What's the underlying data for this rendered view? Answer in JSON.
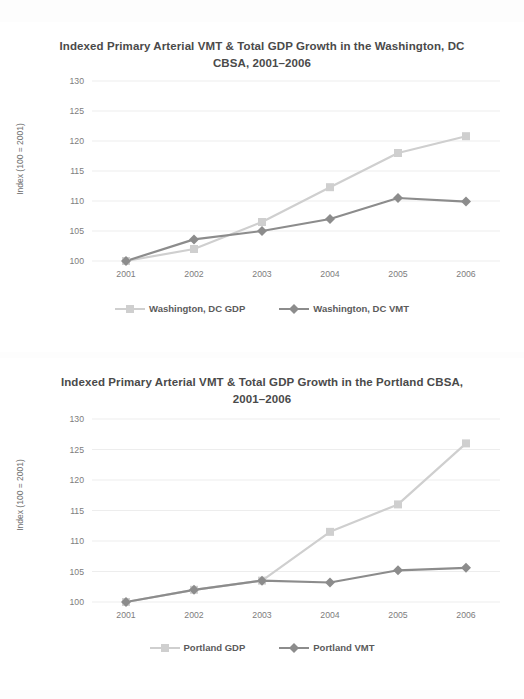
{
  "figures": [
    {
      "id": "washington",
      "title": "Indexed Primary Arterial VMT & Total GDP Growth in the Washington, DC CBSA, 2001–2006",
      "legend": [
        {
          "label": "Washington, DC GDP",
          "marker": "square",
          "color": "#cfcfcf"
        },
        {
          "label": "Washington, DC VMT",
          "marker": "diamond",
          "color": "#8c8c8c"
        }
      ]
    },
    {
      "id": "portland",
      "title": "Indexed Primary Arterial VMT & Total GDP Growth in the Portland CBSA, 2001–2006",
      "legend": [
        {
          "label": "Portland GDP",
          "marker": "square",
          "color": "#cfcfcf"
        },
        {
          "label": "Portland VMT",
          "marker": "diamond",
          "color": "#8c8c8c"
        }
      ]
    }
  ],
  "chart_data": [
    {
      "type": "line",
      "title": "Indexed Primary Arterial VMT & Total GDP Growth in the Washington, DC CBSA, 2001–2006",
      "xlabel": "",
      "ylabel": "Index (100 = 2001)",
      "categories": [
        "2001",
        "2002",
        "2003",
        "2004",
        "2005",
        "2006"
      ],
      "x": [
        2001,
        2002,
        2003,
        2004,
        2005,
        2006
      ],
      "ylim": [
        100,
        130
      ],
      "yticks": [
        100,
        105,
        110,
        115,
        120,
        125,
        130
      ],
      "grid": true,
      "legend_position": "bottom",
      "series": [
        {
          "name": "Washington, DC GDP",
          "color": "#cfcfcf",
          "marker": "square",
          "values": [
            100,
            102,
            106.5,
            112.3,
            118,
            120.8
          ]
        },
        {
          "name": "Washington, DC VMT",
          "color": "#8c8c8c",
          "marker": "diamond",
          "values": [
            100,
            103.6,
            105,
            107,
            110.5,
            109.9
          ]
        }
      ]
    },
    {
      "type": "line",
      "title": "Indexed Primary Arterial VMT & Total GDP Growth in the Portland CBSA, 2001–2006",
      "xlabel": "",
      "ylabel": "Index (100 = 2001)",
      "categories": [
        "2001",
        "2002",
        "2003",
        "2004",
        "2005",
        "2006"
      ],
      "x": [
        2001,
        2002,
        2003,
        2004,
        2005,
        2006
      ],
      "ylim": [
        100,
        130
      ],
      "yticks": [
        100,
        105,
        110,
        115,
        120,
        125,
        130
      ],
      "grid": true,
      "legend_position": "bottom",
      "series": [
        {
          "name": "Portland GDP",
          "color": "#cfcfcf",
          "marker": "square",
          "values": [
            100,
            102,
            103.5,
            111.5,
            116,
            126
          ]
        },
        {
          "name": "Portland VMT",
          "color": "#8c8c8c",
          "marker": "diamond",
          "values": [
            100,
            102,
            103.5,
            103.2,
            105.2,
            105.6
          ]
        }
      ]
    }
  ],
  "colors": {
    "gdp": "#cfcfcf",
    "vmt": "#8c8c8c",
    "grid": "#ededed",
    "tick_text": "#7d7d7d",
    "title_text": "#4a4a4a",
    "background": "#ffffff"
  }
}
